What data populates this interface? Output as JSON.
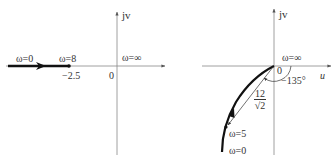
{
  "figure": {
    "left_plot": {
      "axis_labels": {
        "vertical": "jv",
        "horizontal": "u",
        "origin": "0"
      },
      "labels": {
        "omega_start": "ω=0",
        "omega_mid": "ω=8",
        "omega_inf": "ω=∞",
        "point_value": "−2.5"
      },
      "path": {
        "type": "line-segment",
        "from_u": "-∞",
        "to_u": -2.5,
        "direction": "toward origin"
      }
    },
    "right_plot": {
      "axis_labels": {
        "vertical": "jv",
        "horizontal": "u",
        "origin": "0"
      },
      "labels": {
        "omega_inf": "ω=∞",
        "omega_5": "ω=5",
        "omega_0": "ω=0",
        "angle": "−135°",
        "magnitude_num": "12",
        "magnitude_den": "√2"
      },
      "path": {
        "type": "curve",
        "from": "ω=0 (third quadrant, far)",
        "to": "origin at ω=∞"
      }
    },
    "colors": {
      "axis": "#777777",
      "curve": "#111111",
      "text": "#333333"
    }
  }
}
